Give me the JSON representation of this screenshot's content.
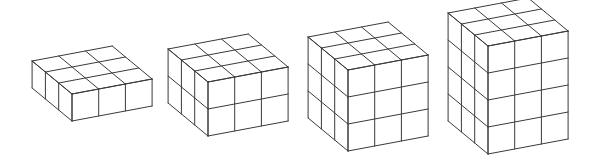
{
  "figure": {
    "description": "Sequence of four cube stacks built from 3x3 layers of unit cubes, increasing in height from 1 to 4 layers",
    "line_color": "#3a3a3a",
    "background": "#ffffff",
    "unit": {
      "u": [
        26.7,
        -5
      ],
      "v": [
        0,
        27
      ],
      "d": [
        -13.3,
        -11
      ]
    },
    "stacks": [
      {
        "label": "Stack 1",
        "columns": 3,
        "depth": 3,
        "layers": 1,
        "front_top_left": [
          72,
          94
        ]
      },
      {
        "label": "Stack 2",
        "columns": 3,
        "depth": 3,
        "layers": 2,
        "front_top_left": [
          208,
          82
        ]
      },
      {
        "label": "Stack 3",
        "columns": 3,
        "depth": 3,
        "layers": 3,
        "front_top_left": [
          348,
          70
        ]
      },
      {
        "label": "Stack 4",
        "columns": 3,
        "depth": 3,
        "layers": 4,
        "front_top_left": [
          488,
          46
        ]
      }
    ]
  }
}
